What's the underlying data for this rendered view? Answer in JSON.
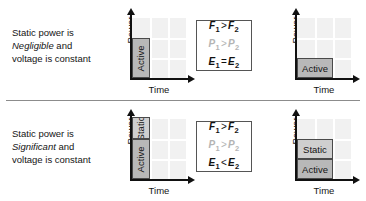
{
  "figure": {
    "axis": {
      "ylabel": "Power",
      "xlabel": "Time"
    },
    "colors": {
      "active_fill": "#b8b8b8",
      "static_fill": "#cfcfcf",
      "plot_background": "#f1f1f1",
      "gridline": "#ffffff",
      "axis": "#111111",
      "muted_text": "#b4b4b4"
    }
  },
  "rows": [
    {
      "id": "negligible-static-power",
      "caption": {
        "line1": "Static power is",
        "emphasis": "Negligible",
        "line2_suffix": " and",
        "line3": "voltage is constant"
      },
      "chart_left": {
        "ylabel": "Power",
        "xlabel": "Time",
        "blocks": [
          {
            "label": "Active",
            "orientation": "vertical",
            "fill": "active",
            "cols": 1,
            "rows": 2
          }
        ]
      },
      "chart_right": {
        "ylabel": "Power",
        "xlabel": "Time",
        "blocks": [
          {
            "label": "Active",
            "orientation": "horizontal",
            "fill": "active",
            "cols": 2,
            "rows": 1
          }
        ]
      },
      "equations": [
        {
          "lhs": "F",
          "lsub": "1",
          "op": ">",
          "rhs": "F",
          "rsub": "2",
          "muted": false
        },
        {
          "lhs": "P",
          "lsub": "1",
          "op": ">",
          "rhs": "P",
          "rsub": "2",
          "muted": true
        },
        {
          "lhs": "E",
          "lsub": "1",
          "op": "=",
          "rhs": "E",
          "rsub": "2",
          "muted": false
        }
      ]
    },
    {
      "id": "significant-static-power",
      "caption": {
        "line1": "Static power is",
        "emphasis": "Significant",
        "line2_suffix": " and",
        "line3": "voltage is constant"
      },
      "chart_left": {
        "ylabel": "Power",
        "xlabel": "Time",
        "blocks": [
          {
            "label": "Active",
            "orientation": "vertical",
            "fill": "active",
            "cols": 1,
            "rows": 2
          },
          {
            "label": "Static",
            "orientation": "vertical",
            "fill": "static",
            "cols": 1,
            "rows": 1
          }
        ]
      },
      "chart_right": {
        "ylabel": "Power",
        "xlabel": "Time",
        "blocks": [
          {
            "label": "Active",
            "orientation": "horizontal",
            "fill": "active",
            "cols": 2,
            "rows": 1
          },
          {
            "label": "Static",
            "orientation": "horizontal",
            "fill": "static",
            "cols": 2,
            "rows": 1
          }
        ]
      },
      "equations": [
        {
          "lhs": "F",
          "lsub": "1",
          "op": ">",
          "rhs": "F",
          "rsub": "2",
          "muted": false
        },
        {
          "lhs": "P",
          "lsub": "1",
          "op": ">",
          "rhs": "P",
          "rsub": "2",
          "muted": true
        },
        {
          "lhs": "E",
          "lsub": "1",
          "op": "<",
          "rhs": "E",
          "rsub": "2",
          "muted": false
        }
      ]
    }
  ]
}
